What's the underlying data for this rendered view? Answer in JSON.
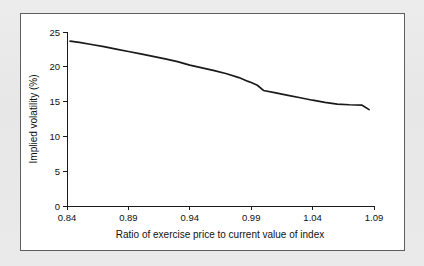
{
  "figure": {
    "background_color": "#ffffff",
    "page_background_color": "#e9e9e9",
    "frame_color": "#5e5e5e"
  },
  "chart_data": {
    "type": "line",
    "title": "",
    "subtitle": "",
    "xlabel": "Ratio of exercise price to current value of index",
    "ylabel": "Implied volatility (%)",
    "xlim": [
      0.84,
      1.09
    ],
    "ylim": [
      0,
      25
    ],
    "xticks": [
      0.84,
      0.89,
      0.94,
      0.99,
      1.04,
      1.09
    ],
    "xtick_labels": [
      "0.84",
      "0.89",
      "0.94",
      "0.99",
      "1.04",
      "1.09"
    ],
    "yticks": [
      0,
      5,
      10,
      15,
      20,
      25
    ],
    "ytick_labels": [
      "0",
      "5",
      "10",
      "15",
      "20",
      "25"
    ],
    "grid": false,
    "legend": false,
    "legend_position": "none",
    "line_color": "#1a1a1a",
    "series": [
      {
        "name": "Implied volatility",
        "x": [
          0.8425,
          0.85,
          0.86,
          0.87,
          0.88,
          0.89,
          0.9,
          0.91,
          0.92,
          0.93,
          0.94,
          0.95,
          0.96,
          0.97,
          0.98,
          0.9875,
          0.99,
          0.995,
          1.0,
          1.01,
          1.02,
          1.03,
          1.04,
          1.05,
          1.06,
          1.07,
          1.08,
          1.086
        ],
        "y": [
          23.7,
          23.5,
          23.2,
          22.9,
          22.55,
          22.2,
          21.85,
          21.5,
          21.15,
          20.75,
          20.25,
          19.85,
          19.45,
          19.0,
          18.45,
          17.9,
          17.75,
          17.35,
          16.6,
          16.25,
          15.9,
          15.55,
          15.2,
          14.9,
          14.65,
          14.55,
          14.5,
          13.85
        ]
      }
    ]
  }
}
